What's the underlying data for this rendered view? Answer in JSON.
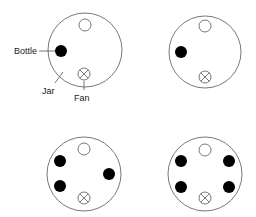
{
  "labels": {
    "bottle": "Bottle",
    "jar": "Jar",
    "fan": "Fan"
  },
  "colors": {
    "stroke": "#555555",
    "bottle_fill": "#000000",
    "background": "#ffffff"
  },
  "panels": [
    {
      "id": "panel-1",
      "jar": {
        "cx": 85,
        "cy": 50,
        "r": 37
      },
      "open": {
        "cx": 85,
        "cy": 25
      },
      "bottles": [
        {
          "cx": 61,
          "cy": 51
        }
      ],
      "fan": {
        "cx": 84,
        "cy": 74
      }
    },
    {
      "id": "panel-2",
      "jar": {
        "cx": 205,
        "cy": 52,
        "r": 36
      },
      "open": {
        "cx": 205,
        "cy": 26
      },
      "bottles": [
        {
          "cx": 181,
          "cy": 52
        }
      ],
      "fan": {
        "cx": 205,
        "cy": 77
      }
    },
    {
      "id": "panel-3",
      "jar": {
        "cx": 84,
        "cy": 174,
        "r": 37
      },
      "open": {
        "cx": 84,
        "cy": 149
      },
      "bottles": [
        {
          "cx": 60,
          "cy": 161
        },
        {
          "cx": 60,
          "cy": 186
        },
        {
          "cx": 109,
          "cy": 174
        }
      ],
      "fan": {
        "cx": 84,
        "cy": 198
      }
    },
    {
      "id": "panel-4",
      "jar": {
        "cx": 205,
        "cy": 174,
        "r": 37
      },
      "open": {
        "cx": 205,
        "cy": 150
      },
      "bottles": [
        {
          "cx": 181,
          "cy": 161
        },
        {
          "cx": 181,
          "cy": 187
        },
        {
          "cx": 229,
          "cy": 161
        },
        {
          "cx": 229,
          "cy": 187
        }
      ],
      "fan": {
        "cx": 205,
        "cy": 198
      }
    }
  ]
}
